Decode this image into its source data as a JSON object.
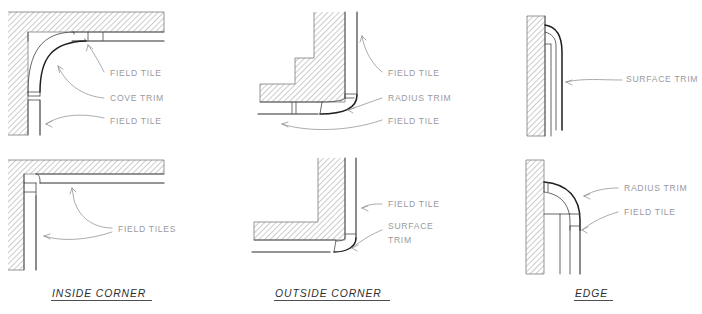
{
  "sheet": {
    "title": "Tile Trim Detail Reference Sheet",
    "background_color": "#ffffff",
    "hatch_color": "#8c8c90",
    "label_color": "#9a9a9e",
    "caption_color": "#2e2e2e",
    "tile_line_color": "#1e1e1e",
    "wall_outline_color": "#7b7b7b",
    "leader_color": "#8f8f93"
  },
  "columns": [
    {
      "key": "inside_corner",
      "caption": "INSIDE CORNER",
      "details": [
        {
          "row": "top",
          "name": "inside-corner-cove-detail",
          "labels": [
            {
              "text": "FIELD TILE"
            },
            {
              "text": "COVE TRIM"
            },
            {
              "text": "FIELD TILE"
            }
          ]
        },
        {
          "row": "bottom",
          "name": "inside-corner-field-tiles-detail",
          "labels": [
            {
              "text": "FIELD TILES"
            }
          ]
        }
      ]
    },
    {
      "key": "outside_corner",
      "caption": "OUTSIDE CORNER",
      "details": [
        {
          "row": "top",
          "name": "outside-corner-radius-detail",
          "labels": [
            {
              "text": "FIELD TILE"
            },
            {
              "text": "RADIUS TRIM"
            },
            {
              "text": "FIELD TILE"
            }
          ]
        },
        {
          "row": "bottom",
          "name": "outside-corner-surface-trim-detail",
          "labels": [
            {
              "text": "FIELD TILE"
            },
            {
              "text": "SURFACE"
            },
            {
              "text": "TRIM"
            }
          ]
        }
      ]
    },
    {
      "key": "edge",
      "caption": "EDGE",
      "details": [
        {
          "row": "top",
          "name": "edge-surface-trim-detail",
          "labels": [
            {
              "text": "SURFACE TRIM"
            }
          ]
        },
        {
          "row": "bottom",
          "name": "edge-radius-trim-detail",
          "labels": [
            {
              "text": "RADIUS TRIM"
            },
            {
              "text": "FIELD TILE"
            }
          ]
        }
      ]
    }
  ],
  "labels": {
    "r1c1_a": "FIELD TILE",
    "r1c1_b": "COVE TRIM",
    "r1c1_c": "FIELD TILE",
    "r1c2_a": "FIELD TILE",
    "r1c2_b": "RADIUS TRIM",
    "r1c2_c": "FIELD TILE",
    "r1c3_a": "SURFACE TRIM",
    "r2c1_a": "FIELD TILES",
    "r2c2_a": "FIELD TILE",
    "r2c2_b": "SURFACE",
    "r2c2_c": "TRIM",
    "r2c3_a": "RADIUS TRIM",
    "r2c3_b": "FIELD TILE"
  },
  "captions": {
    "inside_corner": "INSIDE CORNER",
    "outside_corner": "OUTSIDE CORNER",
    "edge": "EDGE"
  }
}
